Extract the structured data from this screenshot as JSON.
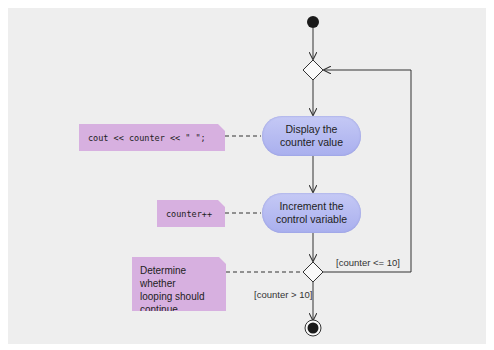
{
  "diagram": {
    "type": "UML activity diagram",
    "colors": {
      "background": "#eeeeee",
      "action_fill": "#b7bcf2",
      "note_fill": "#d7b0e0",
      "line": "#333333"
    },
    "nodes": {
      "initial": {
        "kind": "initial-node"
      },
      "merge": {
        "kind": "merge-node"
      },
      "action_display": {
        "kind": "action",
        "label_line1": "Display the",
        "label_line2": "counter value"
      },
      "action_increment": {
        "kind": "action",
        "label_line1": "Increment the",
        "label_line2": "control variable"
      },
      "decision": {
        "kind": "decision-node"
      },
      "final": {
        "kind": "final-node"
      }
    },
    "notes": {
      "display_code": "cout << counter << \" \";",
      "increment_code": "counter++",
      "decision_note_line1": "Determine whether",
      "decision_note_line2": "looping should",
      "decision_note_line3": "continue"
    },
    "guards": {
      "loop": "[counter <= 10]",
      "exit": "[counter > 10]"
    }
  }
}
